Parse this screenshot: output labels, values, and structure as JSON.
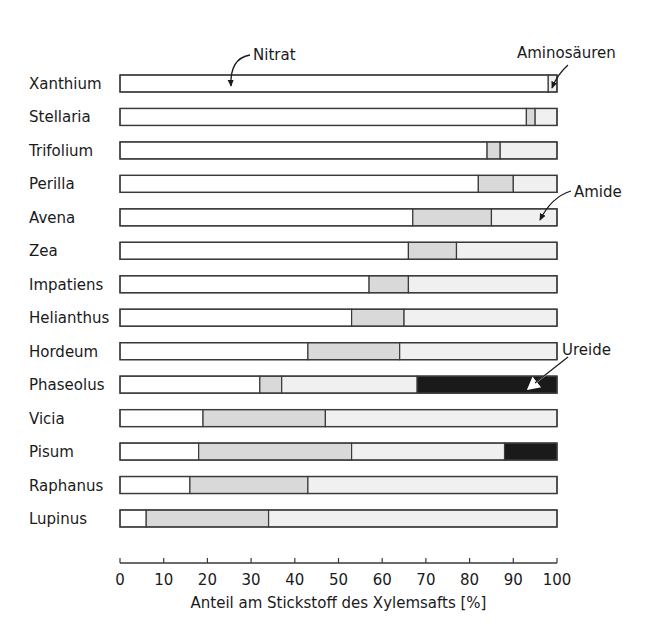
{
  "chart_data": {
    "type": "bar",
    "orientation": "horizontal",
    "stacked": true,
    "title": "",
    "xlabel": "Anteil am Stickstoff des Xylemsafts [%]",
    "ylabel": "",
    "xlim": [
      0,
      100
    ],
    "xticks": [
      0,
      10,
      20,
      30,
      40,
      50,
      60,
      70,
      80,
      90,
      100
    ],
    "grid": false,
    "categories": [
      "Xanthium",
      "Stellaria",
      "Trifolium",
      "Perilla",
      "Avena",
      "Zea",
      "Impatiens",
      "Helianthus",
      "Hordeum",
      "Phaseolus",
      "Vicia",
      "Pisum",
      "Raphanus",
      "Lupinus"
    ],
    "series": [
      {
        "name": "Nitrat",
        "color": "#ffffff",
        "values": [
          98,
          93,
          84,
          82,
          67,
          66,
          57,
          53,
          43,
          32,
          19,
          18,
          16,
          6
        ]
      },
      {
        "name": "Aminosäuren",
        "color": "#d9d9d9",
        "values": [
          0,
          2,
          3,
          8,
          18,
          11,
          9,
          12,
          21,
          5,
          28,
          35,
          27,
          28
        ]
      },
      {
        "name": "Amide",
        "color": "#f0f0f0",
        "values": [
          2,
          5,
          13,
          10,
          15,
          23,
          34,
          35,
          36,
          31,
          53,
          35,
          57,
          66
        ]
      },
      {
        "name": "Ureide",
        "color": "#1a1a1a",
        "values": [
          0,
          0,
          0,
          0,
          0,
          0,
          0,
          0,
          0,
          32,
          0,
          12,
          0,
          0
        ]
      }
    ],
    "annotations": [
      {
        "text": "Nitrat",
        "points_to": "Xanthium nitrate segment"
      },
      {
        "text": "Aminosäuren",
        "points_to": "Xanthium amino-acid divider"
      },
      {
        "text": "Amide",
        "points_to": "Avena amide segment"
      },
      {
        "text": "Ureide",
        "points_to": "Phaseolus ureide segment"
      }
    ]
  },
  "labels": {
    "nitrat": "Nitrat",
    "aminosaeuren": "Aminosäuren",
    "amide": "Amide",
    "ureide": "Ureide"
  }
}
